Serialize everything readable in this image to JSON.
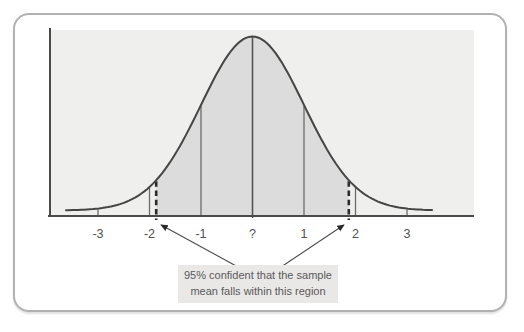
{
  "figure": {
    "frame_border_color": "#b1b1b1",
    "page_background": "#ffffff"
  },
  "chart_data": {
    "type": "area",
    "title": "",
    "x_ticks": [
      {
        "value": -3,
        "label": "-3"
      },
      {
        "value": -2,
        "label": "-2"
      },
      {
        "value": -1,
        "label": "-1"
      },
      {
        "value": 0,
        "label": "?"
      },
      {
        "value": 1,
        "label": "1"
      },
      {
        "value": 2,
        "label": "2"
      },
      {
        "value": 3,
        "label": "3"
      }
    ],
    "x_range": [
      -3.6,
      4.3
    ],
    "curve": {
      "distribution": "normal",
      "mean_label": "?",
      "sd": 1
    },
    "marker_lines_sigma": [
      -3,
      -2,
      -1,
      0,
      1,
      2,
      3
    ],
    "shaded_interval_sigma": [
      -1.96,
      1.96
    ],
    "confidence_level": "95%",
    "annotation": {
      "line1": "95% confident that the sample",
      "line2": "mean falls within this region"
    },
    "layout_hints": {
      "grid": false,
      "legend": false,
      "dashed_draw_sigma": 1.87,
      "annotation_position": "below-axis-center"
    }
  },
  "colors": {
    "plot_background": "#efefee",
    "shaded_region": "#dcdcdc",
    "curve_stroke": "#454545",
    "axis_stroke": "#4a4a4a",
    "marker_line": "#6b6b6b",
    "dashed_line": "#2b2b2b",
    "arrow": "#4a4a4a",
    "tick_label": "#4f4f4f",
    "annotation_background": "#e9e8e7",
    "annotation_text": "#5a5a5a"
  }
}
